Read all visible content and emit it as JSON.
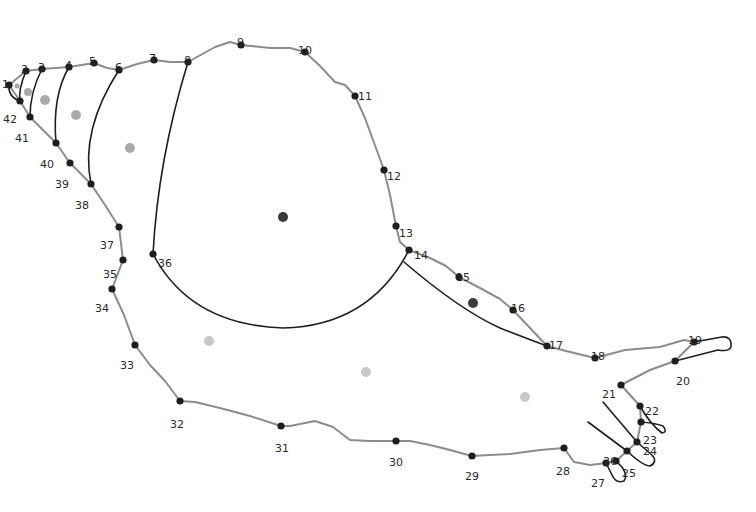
{
  "diagram": {
    "type": "landmark-outline",
    "colors": {
      "outline": "#8c8c8c",
      "partition": "#1e1e1e",
      "landmark": "#1e1e1e",
      "label": "#2a2a2a",
      "centroid_dark": "#3a3a3a",
      "centroid_gray": "#a9a9a9",
      "centroid_light": "#c8c8c8"
    },
    "landmarks": [
      {
        "id": "1",
        "x": 9,
        "y": 85,
        "lx": 2,
        "ly": 79,
        "label": "1"
      },
      {
        "id": "2",
        "x": 26,
        "y": 71,
        "lx": 21,
        "ly": 64,
        "label": "2"
      },
      {
        "id": "3",
        "x": 42,
        "y": 69,
        "lx": 38,
        "ly": 62,
        "label": "3"
      },
      {
        "id": "4",
        "x": 69,
        "y": 67,
        "lx": 65,
        "ly": 60,
        "label": "4"
      },
      {
        "id": "5",
        "x": 94,
        "y": 63,
        "lx": 89,
        "ly": 56,
        "label": "5"
      },
      {
        "id": "6",
        "x": 119,
        "y": 70,
        "lx": 115,
        "ly": 62,
        "label": "6"
      },
      {
        "id": "7",
        "x": 154,
        "y": 60,
        "lx": 149,
        "ly": 53,
        "label": "7"
      },
      {
        "id": "8",
        "x": 188,
        "y": 62,
        "lx": 184,
        "ly": 55,
        "label": "8"
      },
      {
        "id": "9",
        "x": 241,
        "y": 45,
        "lx": 237,
        "ly": 37,
        "label": "9"
      },
      {
        "id": "10",
        "x": 305,
        "y": 52,
        "lx": 298,
        "ly": 45,
        "label": "10"
      },
      {
        "id": "11",
        "x": 355,
        "y": 96,
        "lx": 358,
        "ly": 91,
        "label": "11"
      },
      {
        "id": "12",
        "x": 384,
        "y": 170,
        "lx": 387,
        "ly": 171,
        "label": "12"
      },
      {
        "id": "13",
        "x": 396,
        "y": 226,
        "lx": 399,
        "ly": 228,
        "label": "13"
      },
      {
        "id": "14",
        "x": 409,
        "y": 250,
        "lx": 414,
        "ly": 250,
        "label": "14"
      },
      {
        "id": "15",
        "x": 459,
        "y": 277,
        "lx": 456,
        "ly": 272,
        "label": "15"
      },
      {
        "id": "16",
        "x": 513,
        "y": 310,
        "lx": 511,
        "ly": 303,
        "label": "16"
      },
      {
        "id": "17",
        "x": 547,
        "y": 346,
        "lx": 549,
        "ly": 340,
        "label": "17"
      },
      {
        "id": "18",
        "x": 595,
        "y": 358,
        "lx": 591,
        "ly": 351,
        "label": "18"
      },
      {
        "id": "19",
        "x": 694,
        "y": 342,
        "lx": 688,
        "ly": 335,
        "label": "19"
      },
      {
        "id": "20",
        "x": 675,
        "y": 361,
        "lx": 676,
        "ly": 376,
        "label": "20"
      },
      {
        "id": "21",
        "x": 621,
        "y": 385,
        "lx": 602,
        "ly": 389,
        "label": "21"
      },
      {
        "id": "22",
        "x": 640,
        "y": 406,
        "lx": 645,
        "ly": 406,
        "label": "22"
      },
      {
        "id": "23",
        "x": 641,
        "y": 422,
        "lx": 643,
        "ly": 435,
        "label": "23"
      },
      {
        "id": "24",
        "x": 637,
        "y": 442,
        "lx": 643,
        "ly": 446,
        "label": "24"
      },
      {
        "id": "25",
        "x": 627,
        "y": 451,
        "lx": 622,
        "ly": 468,
        "label": "25"
      },
      {
        "id": "26",
        "x": 616,
        "y": 461,
        "lx": 603,
        "ly": 456,
        "label": "26"
      },
      {
        "id": "27",
        "x": 606,
        "y": 463,
        "lx": 591,
        "ly": 478,
        "label": "27"
      },
      {
        "id": "28",
        "x": 564,
        "y": 448,
        "lx": 556,
        "ly": 466,
        "label": "28"
      },
      {
        "id": "29",
        "x": 472,
        "y": 456,
        "lx": 465,
        "ly": 471,
        "label": "29"
      },
      {
        "id": "30",
        "x": 396,
        "y": 441,
        "lx": 389,
        "ly": 457,
        "label": "30"
      },
      {
        "id": "31",
        "x": 281,
        "y": 426,
        "lx": 275,
        "ly": 443,
        "label": "31"
      },
      {
        "id": "32",
        "x": 180,
        "y": 401,
        "lx": 170,
        "ly": 419,
        "label": "32"
      },
      {
        "id": "33",
        "x": 135,
        "y": 345,
        "lx": 120,
        "ly": 360,
        "label": "33"
      },
      {
        "id": "34",
        "x": 112,
        "y": 289,
        "lx": 95,
        "ly": 303,
        "label": "34"
      },
      {
        "id": "35",
        "x": 123,
        "y": 260,
        "lx": 103,
        "ly": 269,
        "label": "35"
      },
      {
        "id": "36",
        "x": 153,
        "y": 254,
        "lx": 158,
        "ly": 258,
        "label": "36"
      },
      {
        "id": "37",
        "x": 119,
        "y": 227,
        "lx": 100,
        "ly": 240,
        "label": "37"
      },
      {
        "id": "38",
        "x": 91,
        "y": 184,
        "lx": 75,
        "ly": 200,
        "label": "38"
      },
      {
        "id": "39",
        "x": 70,
        "y": 163,
        "lx": 55,
        "ly": 179,
        "label": "39"
      },
      {
        "id": "40",
        "x": 56,
        "y": 143,
        "lx": 40,
        "ly": 159,
        "label": "40"
      },
      {
        "id": "41",
        "x": 30,
        "y": 117,
        "lx": 15,
        "ly": 133,
        "label": "41"
      },
      {
        "id": "42",
        "x": 20,
        "y": 101,
        "lx": 3,
        "ly": 114,
        "label": "42"
      }
    ],
    "centroids": [
      {
        "x": 17,
        "y": 86,
        "r": 2.5,
        "tone": "gray"
      },
      {
        "x": 28,
        "y": 92,
        "r": 4,
        "tone": "gray"
      },
      {
        "x": 45,
        "y": 100,
        "r": 5,
        "tone": "gray"
      },
      {
        "x": 76,
        "y": 115,
        "r": 5,
        "tone": "gray"
      },
      {
        "x": 130,
        "y": 148,
        "r": 5,
        "tone": "gray"
      },
      {
        "x": 283,
        "y": 217,
        "r": 5,
        "tone": "dark"
      },
      {
        "x": 473,
        "y": 303,
        "r": 5,
        "tone": "dark"
      },
      {
        "x": 209,
        "y": 341,
        "r": 5,
        "tone": "light"
      },
      {
        "x": 366,
        "y": 372,
        "r": 5,
        "tone": "light"
      },
      {
        "x": 525,
        "y": 397,
        "r": 5,
        "tone": "light"
      }
    ],
    "outline_path": "M9,85 L26,71 L42,69 L69,67 L94,63 L107,68 L119,70 L137,64 L154,60 L170,62 L188,62 L215,47 L230,42 L241,45 L270,48 L290,48 L305,52 L320,66 L335,82 L345,85 L355,96 L365,118 L373,140 L384,170 L390,195 L396,226 L400,242 L409,250 L430,258 L446,266 L459,277 L480,288 L500,299 L513,310 L530,328 L547,346 L570,352 L595,358 L625,350 L660,347 L684,340 L694,342 M694,342 L675,361 M675,361 L650,370 L621,385 L640,406 L641,422 L637,442 L627,451 L616,461 L606,463 L590,465 L574,462 L564,448 L540,450 L510,454 L490,455 L472,456 L450,450 L430,445 L410,441 L396,441 L370,441 L350,440 L333,427 L315,421 L300,424 L290,426 L281,426 L250,416 L220,408 L195,402 L180,401 L165,381 L150,365 L135,345 L124,315 L112,289 L123,260 L119,227 L105,205 L91,184 L70,163 L56,143 L44,131 L30,117 L20,101 L9,85",
    "partition_paths": [
      "M9,85 Q8,97 20,101",
      "M26,71 Q18,90 20,101",
      "M42,69 Q30,92 30,117",
      "M69,67 Q52,96 56,143",
      "M119,70 Q80,130 91,184",
      "M188,62 Q158,160 153,254",
      "M153,254 Q190,325 283,328 Q370,326 409,250",
      "M404,262 Q460,310 500,328 Q525,338 547,346",
      "M694,342 L722,337 Q732,336 731,347 Q729,352 718,350 L675,361",
      "M641,422 Q655,423 663,426 Q668,432 662,433 Q650,424 640,406",
      "M603,402 L637,442 L652,455 Q658,462 650,466 Q643,466 627,451 L588,422",
      "M606,463 L612,475 Q616,484 624,481 Q628,476 622,467 L616,461"
    ]
  }
}
